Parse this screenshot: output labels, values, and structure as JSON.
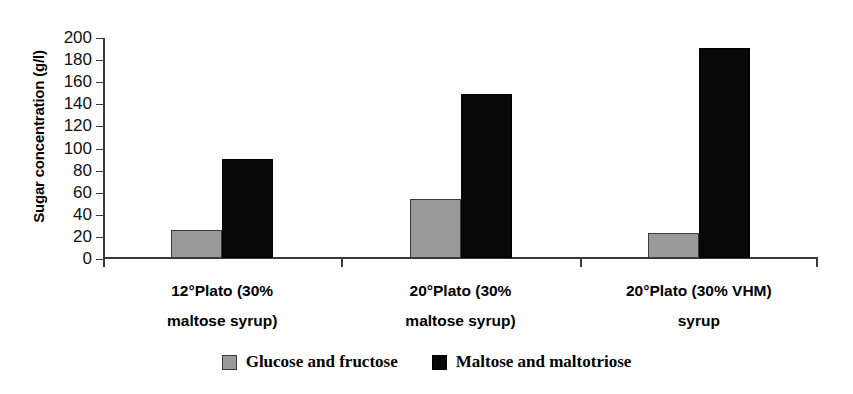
{
  "chart_data": {
    "type": "bar",
    "title": "",
    "xlabel": "",
    "ylabel": "Sugar concentration (g/l)",
    "ylim": [
      0,
      200
    ],
    "ytick_step": 20,
    "yticks": [
      200,
      180,
      160,
      140,
      120,
      100,
      80,
      60,
      40,
      20,
      0
    ],
    "grid": false,
    "legend_position": "bottom-center",
    "categories": [
      "12°Plato (30% maltose syrup)",
      "20°Plato (30% maltose syrup)",
      "20°Plato (30% VHM) syrup"
    ],
    "category_lines": [
      [
        "12°Plato (30%",
        "maltose syrup)"
      ],
      [
        "20°Plato (30%",
        "maltose syrup)"
      ],
      [
        "20°Plato (30% VHM)",
        "syrup"
      ]
    ],
    "series": [
      {
        "name": "Glucose and fructose",
        "color": "#9a9a9a",
        "values": [
          25,
          53,
          23
        ]
      },
      {
        "name": "Maltose and maltotriose",
        "color": "#080808",
        "values": [
          90,
          148,
          190
        ]
      }
    ]
  },
  "legend": {
    "items": [
      {
        "label": "Glucose and fructose",
        "swatch": "gray-swatch-icon"
      },
      {
        "label": "Maltose and maltotriose",
        "swatch": "black-swatch-icon"
      }
    ]
  }
}
